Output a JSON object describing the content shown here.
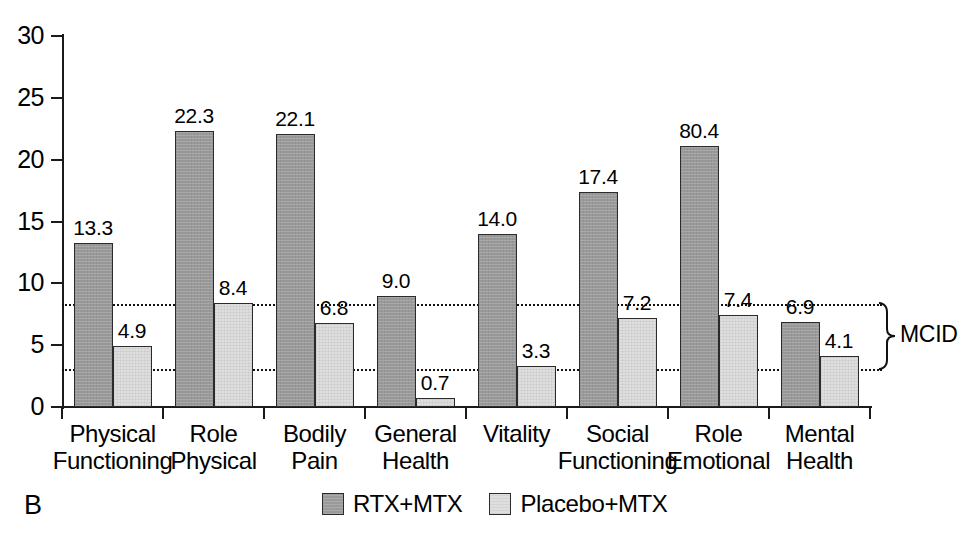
{
  "panel": {
    "label": "B"
  },
  "legend": {
    "entries": [
      {
        "label": "RTX+MTX",
        "color": "#9a9a9a",
        "style": "dark"
      },
      {
        "label": "Placebo+MTX",
        "color": "#dedede",
        "style": "light"
      }
    ]
  },
  "annotation": {
    "mcid_label": "MCID",
    "mcid_upper": 8.3,
    "mcid_lower": 3.1
  },
  "chart_data": {
    "type": "bar",
    "title": "",
    "xlabel": "",
    "ylabel": "",
    "ylim": [
      0,
      30
    ],
    "yticks": [
      0,
      5,
      10,
      15,
      20,
      25,
      30
    ],
    "ytick_labels": [
      "0",
      "5",
      "10",
      "15",
      "20",
      "25",
      "30"
    ],
    "grid": false,
    "legend_position": "bottom-center",
    "categories": [
      "Physical Functioning",
      "Role Physical",
      "Bodily Pain",
      "General Health",
      "Vitality",
      "Social Functioning",
      "Role Emotional",
      "Mental Health"
    ],
    "category_lines": [
      [
        "Physical",
        "Functioning"
      ],
      [
        "Role",
        "Physical"
      ],
      [
        "Bodily",
        "Pain"
      ],
      [
        "General",
        "Health"
      ],
      [
        "Vitality"
      ],
      [
        "Social",
        "Functioning"
      ],
      [
        "Role",
        "Emotional"
      ],
      [
        "Mental",
        "Health"
      ]
    ],
    "series": [
      {
        "name": "RTX+MTX",
        "color": "#9a9a9a",
        "values": [
          13.3,
          22.3,
          22.1,
          9.0,
          14.0,
          17.4,
          21.1,
          6.9
        ],
        "labels": [
          "13.3",
          "22.3",
          "22.1",
          "9.0",
          "14.0",
          "17.4",
          "80.4",
          "6.9"
        ]
      },
      {
        "name": "Placebo+MTX",
        "color": "#dedede",
        "values": [
          4.9,
          8.4,
          6.8,
          0.7,
          3.3,
          7.2,
          7.4,
          4.1
        ],
        "labels": [
          "4.9",
          "8.4",
          "6.8",
          "0.7",
          "3.3",
          "7.2",
          "7.4",
          "4.1"
        ]
      }
    ],
    "reference_lines": [
      {
        "value": 8.3,
        "style": "dotted"
      },
      {
        "value": 3.1,
        "style": "dotted"
      }
    ]
  }
}
